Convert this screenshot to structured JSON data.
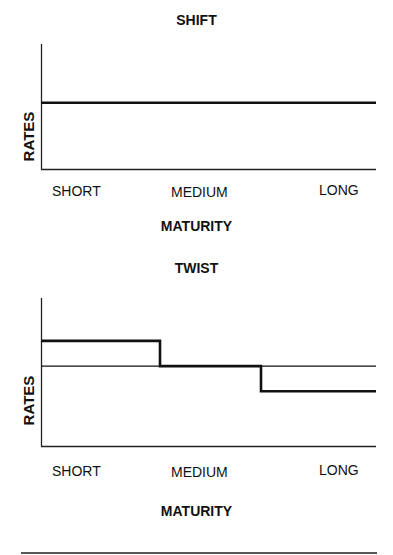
{
  "chart_data": [
    {
      "type": "line",
      "title": "SHIFT",
      "xlabel": "MATURITY",
      "ylabel": "RATES",
      "categories": [
        "SHORT",
        "MEDIUM",
        "LONG"
      ],
      "series": [
        {
          "name": "Yield curve (shifted)",
          "style": "thick",
          "values": [
            0.53,
            0.53,
            0.53
          ]
        }
      ],
      "ylim": [
        0,
        1
      ],
      "grid": false,
      "legend": null
    },
    {
      "type": "line",
      "title": "TWIST",
      "xlabel": "MATURITY",
      "ylabel": "RATES",
      "categories": [
        "SHORT",
        "MEDIUM",
        "LONG"
      ],
      "series": [
        {
          "name": "Original curve",
          "style": "thin",
          "values": [
            0.54,
            0.54,
            0.54
          ]
        },
        {
          "name": "Twisted curve",
          "style": "thick",
          "values": [
            0.71,
            0.54,
            0.37
          ]
        }
      ],
      "ylim": [
        0,
        1
      ],
      "grid": false,
      "legend": null
    }
  ],
  "charts": [
    {
      "title": "SHIFT",
      "ylabel": "RATES",
      "xlabel": "MATURITY",
      "ticks": [
        "SHORT",
        "MEDIUM",
        "LONG"
      ]
    },
    {
      "title": "TWIST",
      "ylabel": "RATES",
      "xlabel": "MATURITY",
      "ticks": [
        "SHORT",
        "MEDIUM",
        "LONG"
      ]
    }
  ],
  "colors": {
    "line": "#111111",
    "axis": "#222222",
    "background": "#ffffff"
  }
}
